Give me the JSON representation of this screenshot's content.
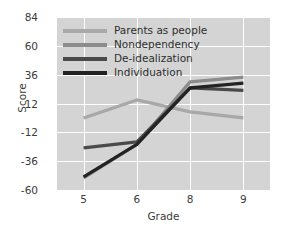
{
  "chart_data": {
    "type": "line",
    "title": "",
    "xlabel": "Grade",
    "ylabel": "Score",
    "categories": [
      "5",
      "6",
      "8",
      "9"
    ],
    "xticklabels": [
      "5",
      "6",
      "8",
      "9"
    ],
    "yticklabels": [
      "84",
      "60",
      "36",
      "12",
      "-12",
      "-36",
      "-60"
    ],
    "ytickvalues": [
      84,
      60,
      36,
      12,
      -12,
      -36,
      -60
    ],
    "ylim": [
      -60,
      84
    ],
    "grid": true,
    "legend_position": "upper-left-inside",
    "plot_background": "#d4d4d4",
    "gridline_color": "#ffffff",
    "series": [
      {
        "name": "Parents as people",
        "color": "#a8a8a8",
        "values": [
          0,
          15,
          5,
          0
        ]
      },
      {
        "name": "Nondependency",
        "color": "#8c8c8c",
        "values": [
          -50,
          -22,
          30,
          34
        ]
      },
      {
        "name": "De-idealization",
        "color": "#4a4a4a",
        "values": [
          -25,
          -20,
          25,
          23
        ]
      },
      {
        "name": "Individuation",
        "color": "#232323",
        "values": [
          -49,
          -22,
          25,
          29
        ]
      }
    ]
  },
  "legend": {
    "items": [
      {
        "label": "Parents as people",
        "color": "#a8a8a8"
      },
      {
        "label": "Nondependency",
        "color": "#8c8c8c"
      },
      {
        "label": "De-idealization",
        "color": "#4a4a4a"
      },
      {
        "label": "Individuation",
        "color": "#232323"
      }
    ]
  }
}
